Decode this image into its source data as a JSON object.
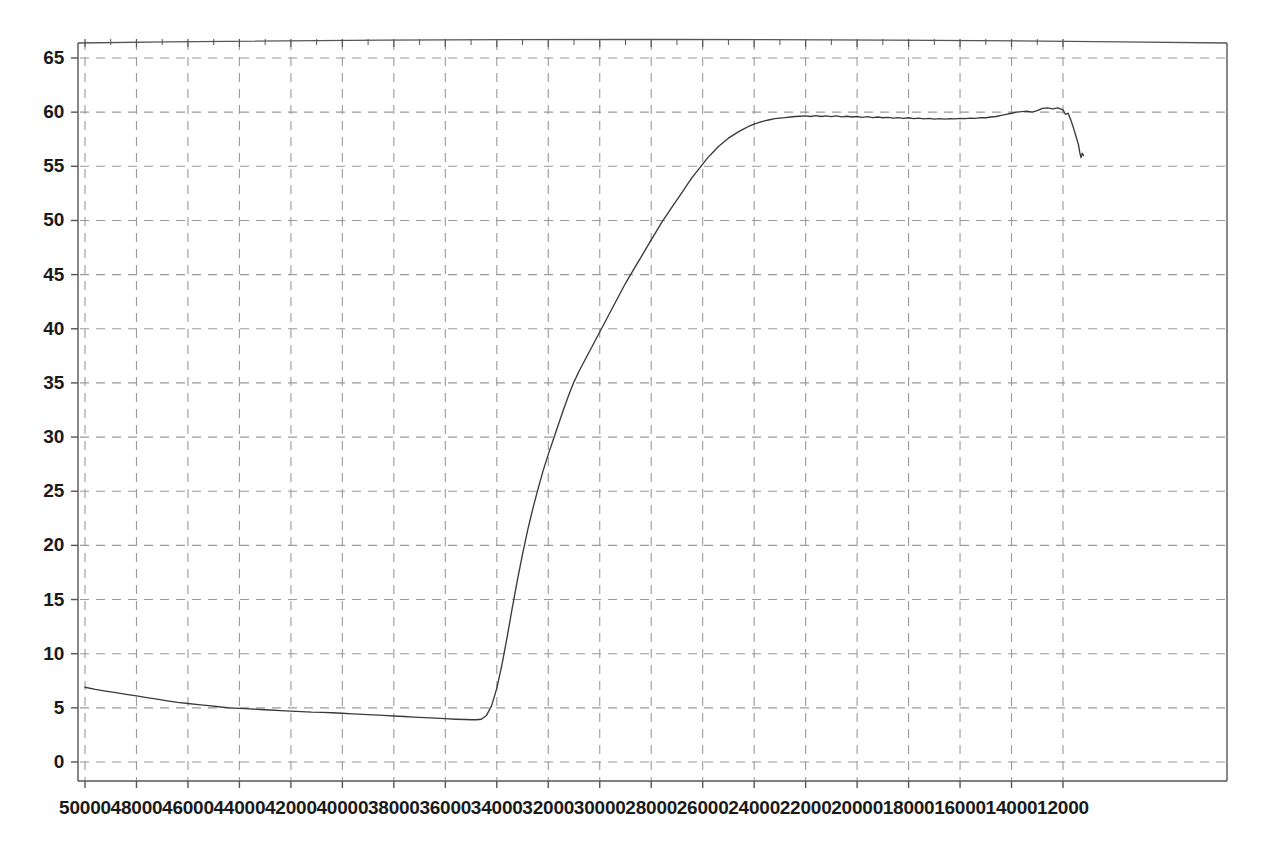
{
  "chart_data": {
    "type": "line",
    "title": "",
    "subtitle": "",
    "xlabel": "",
    "ylabel": "",
    "xlim": [
      50000,
      11200
    ],
    "ylim": [
      0,
      65
    ],
    "x_reversed": true,
    "grid": true,
    "legend": null,
    "x_ticks": [
      50000,
      48000,
      46000,
      44000,
      42000,
      40000,
      38000,
      36000,
      34000,
      32000,
      30000,
      28000,
      26000,
      24000,
      22000,
      20000,
      18000,
      16000,
      14000,
      12000
    ],
    "x_tick_labels": [
      "50000",
      "48000",
      "46000",
      "44000",
      "42000",
      "40000",
      "38000",
      "36000",
      "34000",
      "32000",
      "30000",
      "28000",
      "26000",
      "24000",
      "22000",
      "20000",
      "18000",
      "16000",
      "14000",
      "12000"
    ],
    "y_ticks": [
      0,
      5,
      10,
      15,
      20,
      25,
      30,
      35,
      40,
      45,
      50,
      55,
      60,
      65
    ],
    "y_tick_labels": [
      "0",
      "5",
      "10",
      "15",
      "20",
      "25",
      "30",
      "35",
      "40",
      "45",
      "50",
      "55",
      "60",
      "65"
    ],
    "series": [
      {
        "name": "transmittance",
        "color": "#3a3a3a",
        "x": [
          50000,
          49600,
          49200,
          48800,
          48400,
          48000,
          47600,
          47200,
          46800,
          46400,
          46000,
          45600,
          45200,
          44800,
          44400,
          44000,
          43600,
          43200,
          42800,
          42400,
          42000,
          41600,
          41200,
          40800,
          40400,
          40000,
          39600,
          39200,
          38800,
          38400,
          38000,
          37600,
          37200,
          36800,
          36400,
          36000,
          35600,
          35200,
          35000,
          34800,
          34600,
          34400,
          34200,
          34000,
          33800,
          33600,
          33400,
          33200,
          33000,
          32800,
          32600,
          32400,
          32200,
          32000,
          31800,
          31600,
          31400,
          31200,
          31000,
          30800,
          30600,
          30400,
          30200,
          30000,
          29800,
          29600,
          29400,
          29200,
          29000,
          28800,
          28600,
          28400,
          28200,
          28000,
          27800,
          27600,
          27400,
          27200,
          27000,
          26800,
          26600,
          26400,
          26200,
          26000,
          25800,
          25600,
          25400,
          25200,
          25000,
          24800,
          24600,
          24400,
          24200,
          24000,
          23800,
          23600,
          23400,
          23200,
          23000,
          22800,
          22600,
          22400,
          22200,
          22000,
          21800,
          21600,
          21400,
          21200,
          21000,
          20800,
          20600,
          20400,
          20200,
          20000,
          19800,
          19600,
          19400,
          19200,
          19000,
          18800,
          18600,
          18400,
          18200,
          18000,
          17800,
          17600,
          17400,
          17200,
          17000,
          16800,
          16600,
          16400,
          16200,
          16000,
          15800,
          15600,
          15400,
          15200,
          15000,
          14800,
          14600,
          14400,
          14200,
          14000,
          13800,
          13600,
          13400,
          13200,
          13000,
          12800,
          12600,
          12400,
          12200,
          12000,
          11900,
          11800,
          11700,
          11600,
          11500,
          11400,
          11350,
          11300,
          11250,
          11200
        ],
        "y": [
          6.9,
          6.7,
          6.55,
          6.4,
          6.25,
          6.1,
          5.95,
          5.8,
          5.65,
          5.5,
          5.4,
          5.3,
          5.2,
          5.1,
          5.0,
          4.95,
          4.9,
          4.85,
          4.8,
          4.75,
          4.7,
          4.65,
          4.6,
          4.58,
          4.55,
          4.5,
          4.45,
          4.4,
          4.35,
          4.3,
          4.25,
          4.2,
          4.15,
          4.1,
          4.05,
          4.0,
          3.95,
          3.92,
          3.9,
          3.9,
          3.95,
          4.3,
          5.2,
          6.8,
          9.0,
          11.5,
          14.2,
          16.8,
          19.2,
          21.4,
          23.4,
          25.2,
          26.9,
          28.4,
          29.8,
          31.2,
          32.6,
          33.9,
          35.1,
          36.1,
          37.0,
          37.9,
          38.8,
          39.7,
          40.6,
          41.5,
          42.4,
          43.3,
          44.2,
          45.0,
          45.8,
          46.6,
          47.4,
          48.2,
          49.0,
          49.8,
          50.5,
          51.2,
          51.9,
          52.6,
          53.3,
          54.0,
          54.6,
          55.2,
          55.8,
          56.3,
          56.8,
          57.2,
          57.6,
          57.9,
          58.2,
          58.45,
          58.7,
          58.9,
          59.05,
          59.2,
          59.3,
          59.4,
          59.45,
          59.5,
          59.55,
          59.6,
          59.62,
          59.65,
          59.6,
          59.68,
          59.6,
          59.66,
          59.58,
          59.65,
          59.56,
          59.62,
          59.55,
          59.6,
          59.52,
          59.58,
          59.5,
          59.55,
          59.48,
          59.52,
          59.45,
          59.5,
          59.42,
          59.48,
          59.4,
          59.45,
          59.38,
          59.42,
          59.35,
          59.4,
          59.35,
          59.4,
          59.38,
          59.42,
          59.4,
          59.45,
          59.42,
          59.5,
          59.48,
          59.55,
          59.6,
          59.7,
          59.8,
          59.9,
          60.0,
          60.05,
          60.1,
          60.0,
          60.15,
          60.35,
          60.4,
          60.3,
          60.4,
          60.2,
          59.8,
          59.9,
          59.3,
          58.6,
          57.8,
          57.0,
          56.3,
          55.8,
          56.2,
          56.0
        ]
      }
    ]
  },
  "axes": {
    "frame_color": "#555555",
    "grid_color": "#9a9a9a",
    "tick_color": "#555555",
    "background": "#ffffff"
  }
}
